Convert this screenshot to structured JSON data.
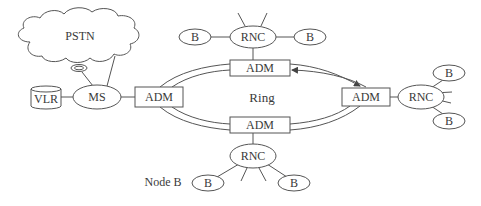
{
  "diagram": {
    "type": "network-topology",
    "colors": {
      "line": "#555555",
      "text": "#3a3a3a",
      "background": "#ffffff"
    },
    "cloud": {
      "label": "PSTN"
    },
    "ring": {
      "label": "Ring"
    },
    "nodes": {
      "vlr": {
        "label": "VLR",
        "shape": "cylinder"
      },
      "ms": {
        "label": "MS",
        "shape": "ellipse"
      },
      "adm_left": {
        "label": "ADM",
        "shape": "rect"
      },
      "adm_top": {
        "label": "ADM",
        "shape": "rect"
      },
      "adm_right": {
        "label": "ADM",
        "shape": "rect"
      },
      "adm_bottom": {
        "label": "ADM",
        "shape": "rect"
      },
      "rnc_top": {
        "label": "RNC",
        "shape": "ellipse"
      },
      "rnc_right": {
        "label": "RNC",
        "shape": "ellipse"
      },
      "rnc_bottom": {
        "label": "RNC",
        "shape": "ellipse"
      },
      "b_top_left": {
        "label": "B",
        "shape": "ellipse"
      },
      "b_top_right": {
        "label": "B",
        "shape": "ellipse"
      },
      "b_right_top": {
        "label": "B",
        "shape": "ellipse"
      },
      "b_right_bottom": {
        "label": "B",
        "shape": "ellipse"
      },
      "b_bottom_left": {
        "label": "B",
        "shape": "ellipse"
      },
      "b_bottom_right": {
        "label": "B",
        "shape": "ellipse"
      }
    },
    "annotations": {
      "node_b": "Node B"
    },
    "edges": [
      [
        "vlr",
        "ms"
      ],
      [
        "ms",
        "adm_left"
      ],
      [
        "ms",
        "PSTN"
      ],
      [
        "ms",
        "PSTN"
      ],
      [
        "adm_top",
        "rnc_top"
      ],
      [
        "adm_right",
        "rnc_right"
      ],
      [
        "adm_bottom",
        "rnc_bottom"
      ],
      [
        "rnc_top",
        "b_top_left"
      ],
      [
        "rnc_top",
        "b_top_right"
      ],
      [
        "rnc_right",
        "b_right_top"
      ],
      [
        "rnc_right",
        "b_right_bottom"
      ],
      [
        "rnc_bottom",
        "b_bottom_left"
      ],
      [
        "rnc_bottom",
        "b_bottom_right"
      ]
    ],
    "ring_direction_arrows": [
      "adm_top -> adm_right (clockwise, outer)",
      "adm_right -> adm_top (counter-clockwise, inner)"
    ]
  }
}
